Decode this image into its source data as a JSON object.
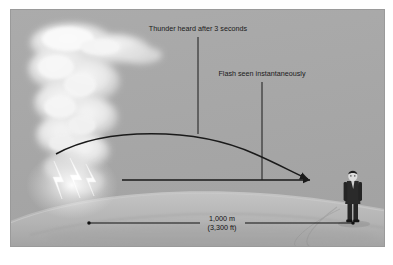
{
  "figure": {
    "background_color": "#ffffff",
    "panel_color": "#a8a8a8",
    "panel_border_color": "#9a9a9a"
  },
  "annotations": {
    "thunder_label": "Thunder heard after 3 seconds",
    "flash_label": "Flash seen instantaneously"
  },
  "dimension": {
    "distance_metric": "1,000 m",
    "distance_imperial": "(3,300 ft)"
  },
  "scene": {
    "cloud_name": "storm cloud",
    "lightning_name": "lightning bolt",
    "observer_name": "observer person",
    "ground_name": "ground horizon",
    "sound_path_name": "curved sound wave path",
    "light_path_name": "straight light path"
  },
  "colors": {
    "sky": "#a8a8a8",
    "cloud_light": "#f4f4f4",
    "cloud_mid": "#d8d8d8",
    "ground_light": "#bdbdbd",
    "ground_shadow": "#9d9d9d",
    "line": "#1a1a1a",
    "lightning": "#fcfcfc",
    "suit": "#2a2a2a",
    "skin": "#dcdcdc"
  }
}
